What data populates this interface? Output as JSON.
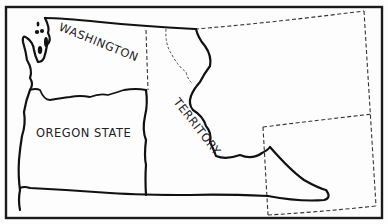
{
  "map": {
    "labels": {
      "washington": "WASHINGTON",
      "oregon": "OREGON STATE",
      "territory": "TERRITORY"
    },
    "colors": {
      "line": "#111111",
      "background": "#fdfdfd"
    }
  }
}
